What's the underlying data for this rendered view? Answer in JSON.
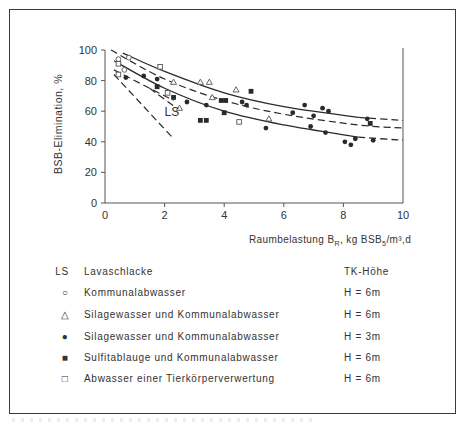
{
  "chart_data": {
    "type": "scatter",
    "title": "",
    "xlabel": "Raumbelastung B_R, kg BSB5/m³,d",
    "xlabel_parts": {
      "pre": "Raumbelastung B",
      "sub1": "R",
      "mid": ", kg BSB",
      "sub2": "5",
      "post": "/m³,d"
    },
    "ylabel": "BSB-Elimination, %",
    "xlim": [
      0,
      10
    ],
    "ylim": [
      0,
      100
    ],
    "xticks": [
      0,
      2,
      4,
      6,
      8,
      10
    ],
    "yticks": [
      0,
      20,
      40,
      60,
      80,
      100
    ],
    "grid": false,
    "annotations": [
      {
        "text": "LS",
        "x": 2.0,
        "y": 57
      }
    ],
    "series": [
      {
        "name": "Kommunalabwasser",
        "marker": "open-circle",
        "height": "H = 6m",
        "points": [
          [
            0.45,
            94
          ],
          [
            0.8,
            95
          ],
          [
            0.65,
            87
          ]
        ]
      },
      {
        "name": "Silagewasser und Kommunalabwasser",
        "marker": "open-triangle",
        "height": "H = 6m",
        "points": [
          [
            2.3,
            79
          ],
          [
            2.5,
            62
          ],
          [
            3.2,
            79
          ],
          [
            3.5,
            79
          ],
          [
            3.6,
            69
          ],
          [
            4.4,
            74
          ],
          [
            5.5,
            55
          ]
        ]
      },
      {
        "name": "Silagewasser und Kommunalabwasser",
        "marker": "filled-circle",
        "height": "H = 3m",
        "points": [
          [
            0.7,
            82
          ],
          [
            1.3,
            83
          ],
          [
            1.75,
            81
          ],
          [
            2.75,
            66
          ],
          [
            3.4,
            64
          ],
          [
            4.6,
            66
          ],
          [
            4.75,
            64
          ],
          [
            5.4,
            49
          ],
          [
            6.3,
            59
          ],
          [
            6.7,
            64
          ],
          [
            6.9,
            50
          ],
          [
            7.0,
            57
          ],
          [
            7.3,
            62
          ],
          [
            7.4,
            46
          ],
          [
            7.5,
            60
          ],
          [
            8.05,
            40
          ],
          [
            8.25,
            38
          ],
          [
            8.4,
            42
          ],
          [
            8.8,
            55
          ],
          [
            9.0,
            41
          ]
        ]
      },
      {
        "name": "Sulfitablauge und Kommunalabwasser",
        "marker": "filled-square",
        "height": "H = 6m",
        "points": [
          [
            1.75,
            76
          ],
          [
            2.3,
            69
          ],
          [
            3.2,
            54
          ],
          [
            3.4,
            54
          ],
          [
            3.9,
            67
          ],
          [
            4.05,
            67
          ],
          [
            4.0,
            59
          ],
          [
            4.9,
            73
          ],
          [
            8.9,
            52
          ]
        ]
      },
      {
        "name": "Abwasser einer Tierkörperverwertung",
        "marker": "open-square",
        "height": "H = 6m",
        "points": [
          [
            0.45,
            91
          ],
          [
            1.85,
            89
          ],
          [
            2.1,
            72
          ],
          [
            0.45,
            84
          ],
          [
            4.5,
            53
          ]
        ]
      }
    ],
    "curves": [
      {
        "name": "upper-envelope",
        "style": "solid-then-dashed",
        "points": [
          [
            0.6,
            98
          ],
          [
            2,
            86
          ],
          [
            4,
            72
          ],
          [
            6,
            63
          ],
          [
            8.5,
            56
          ],
          [
            10,
            54
          ]
        ]
      },
      {
        "name": "middle-trend",
        "style": "dashed",
        "points": [
          [
            0.2,
            100
          ],
          [
            2,
            81
          ],
          [
            4,
            67
          ],
          [
            6,
            58
          ],
          [
            8.5,
            51
          ],
          [
            10,
            49
          ]
        ]
      },
      {
        "name": "lower-envelope",
        "style": "solid-then-dashed",
        "points": [
          [
            0.3,
            93
          ],
          [
            2,
            75
          ],
          [
            4,
            60
          ],
          [
            6,
            51
          ],
          [
            8.5,
            43
          ],
          [
            10,
            41
          ]
        ]
      },
      {
        "name": "LS-upper",
        "style": "dashed",
        "points": [
          [
            0.3,
            87
          ],
          [
            2.3,
            67
          ]
        ]
      },
      {
        "name": "LS-inner",
        "style": "dashed",
        "points": [
          [
            1.5,
            75
          ],
          [
            2.4,
            62
          ]
        ]
      },
      {
        "name": "LS-lower",
        "style": "dashed",
        "points": [
          [
            0.3,
            84
          ],
          [
            2.3,
            42
          ]
        ]
      }
    ]
  },
  "axes": {
    "y_tick_labels": [
      "0",
      "20",
      "40",
      "60",
      "80",
      "100"
    ],
    "x_tick_labels": [
      "0",
      "2",
      "4",
      "6",
      "8",
      "10"
    ]
  },
  "legend": {
    "header": {
      "symbol": "LS",
      "label": "Lavaschlacke",
      "height_col": "TK-Höhe"
    },
    "rows": [
      {
        "symbol": "○",
        "label": "Kommunalabwasser",
        "height": "H = 6m"
      },
      {
        "symbol": "△",
        "label": "Silagewasser und Kommunalabwasser",
        "height": "H = 6m"
      },
      {
        "symbol": "●",
        "label": "Silagewasser und Kommunalabwasser",
        "height": "H = 3m"
      },
      {
        "symbol": "■",
        "label": "Sulfitablauge und Kommunalabwasser",
        "height": "H = 6m"
      },
      {
        "symbol": "□",
        "label": "Abwasser einer Tierkörperverwertung",
        "height": "H = 6m"
      }
    ]
  },
  "colors": {
    "ink": "#2a2a2a",
    "background": "#ffffff",
    "frame": "#3a3a3a"
  }
}
